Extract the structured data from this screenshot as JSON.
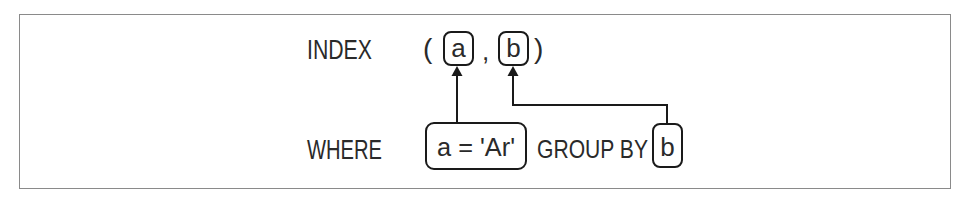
{
  "diagram": {
    "type": "sql-index-column-mapping",
    "frame": {
      "border_color": "#8a8a8a",
      "background": "#ffffff"
    },
    "index_row": {
      "keyword": "INDEX",
      "open_paren": "(",
      "columns": [
        {
          "label": "a"
        },
        {
          "label": "b"
        }
      ],
      "separator": ",",
      "close_paren": ")"
    },
    "query_row": {
      "where_keyword": "WHERE",
      "where_predicate": "a = 'Ar'",
      "group_by_keyword": "GROUP BY",
      "group_by_column": "b"
    },
    "edges": [
      {
        "from": "a = 'Ar'",
        "to": "index column a",
        "style": "arrow-up"
      },
      {
        "from": "GROUP BY b",
        "to": "index column b",
        "style": "elbow-arrow-up"
      }
    ],
    "line_color": "#1a1a1a",
    "text_color": "#2a2a2a"
  }
}
